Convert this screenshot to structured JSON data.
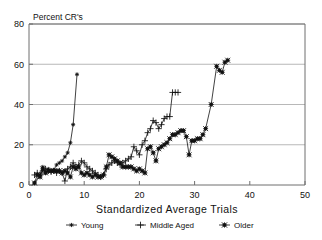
{
  "chart_data": {
    "type": "line",
    "title": "",
    "subtitle": "",
    "corner_label": "Percent CR's",
    "xlabel": "Standardized Average Trials",
    "ylabel": "Percent CR's",
    "xlim": [
      0,
      50
    ],
    "ylim": [
      0,
      80
    ],
    "xticks": [
      0,
      10,
      20,
      30,
      40,
      50
    ],
    "yticks": [
      0,
      20,
      40,
      60,
      80
    ],
    "xtick_labels": [
      "0",
      "10",
      "20",
      "30",
      "40",
      "50"
    ],
    "ytick_labels": [
      "0",
      "20",
      "40",
      "60",
      "80"
    ],
    "grid": "horizontal",
    "legend_position": "bottom-outside",
    "series": [
      {
        "name": "Young",
        "marker": "star",
        "x": [
          1,
          2,
          2.5,
          3,
          3.5,
          4,
          4.5,
          5,
          5.5,
          6,
          6.5,
          7,
          7.5,
          8,
          8.7
        ],
        "y": [
          1,
          5,
          9,
          6,
          8,
          7,
          7.5,
          10,
          11,
          12,
          14,
          16,
          21,
          30,
          55
        ]
      },
      {
        "name": "Middle Aged",
        "marker": "plus",
        "x": [
          1,
          1.5,
          2,
          2.5,
          3,
          3.5,
          4,
          4.5,
          5,
          5.5,
          6,
          6.5,
          7,
          7.5,
          8,
          8.5,
          9,
          9.5,
          10,
          10.5,
          11,
          11.5,
          12,
          12.5,
          13,
          13.5,
          14,
          14.5,
          15,
          15.5,
          16,
          16.5,
          17,
          17.5,
          18,
          18.5,
          19,
          19.5,
          20,
          20.5,
          21,
          21.5,
          22,
          22.5,
          23,
          23.5,
          24,
          24.5,
          25,
          25.5,
          26,
          26.5,
          27
        ],
        "y": [
          5,
          6,
          5,
          7,
          8,
          7,
          6.5,
          7,
          6,
          7,
          6,
          2,
          8,
          9,
          11,
          9,
          10,
          12,
          11,
          9,
          8,
          7,
          6,
          5,
          4,
          5,
          8,
          10,
          11,
          12,
          11,
          10,
          11,
          12,
          13,
          14,
          19,
          17,
          15,
          20,
          22,
          26,
          28,
          32,
          31,
          28,
          30,
          33,
          34,
          34,
          46,
          46,
          46
        ]
      },
      {
        "name": "Older",
        "marker": "square-star",
        "x": [
          1,
          1.5,
          2,
          2.5,
          3,
          3.5,
          4,
          4.5,
          5,
          5.5,
          6,
          6.5,
          7,
          7.5,
          8,
          8.5,
          9,
          9.5,
          10,
          10.5,
          11,
          11.5,
          12,
          12.5,
          13,
          13.5,
          14,
          14.5,
          15,
          15.5,
          16,
          16.5,
          17,
          17.5,
          18,
          18.5,
          19,
          19.5,
          20,
          20.5,
          21,
          21.5,
          22,
          22.5,
          23,
          23.5,
          24,
          24.5,
          25,
          25.5,
          26,
          26.5,
          27,
          27.5,
          28,
          28.5,
          29,
          29.5,
          30,
          30.5,
          31,
          31.5,
          32,
          33,
          34,
          34.5,
          35,
          35.5,
          36
        ],
        "y": [
          1,
          5,
          4,
          8,
          6,
          7,
          7,
          7,
          7,
          7,
          6,
          7,
          6,
          4,
          9,
          8,
          9,
          6,
          5,
          6,
          5,
          4,
          5,
          4,
          4,
          5,
          9,
          15,
          14,
          13,
          12,
          11,
          9,
          9,
          9,
          9,
          8,
          7,
          8,
          7,
          6,
          18,
          19,
          16,
          12,
          18,
          19,
          20,
          21,
          23,
          25,
          25,
          26,
          27,
          27,
          24,
          15,
          22,
          22,
          23,
          23,
          25,
          28,
          40,
          59,
          57,
          56,
          61,
          62
        ]
      }
    ]
  },
  "legend": {
    "items": [
      {
        "label": "Young",
        "marker": "star"
      },
      {
        "label": "Middle Aged",
        "marker": "plus"
      },
      {
        "label": "Older",
        "marker": "square-star"
      }
    ]
  }
}
